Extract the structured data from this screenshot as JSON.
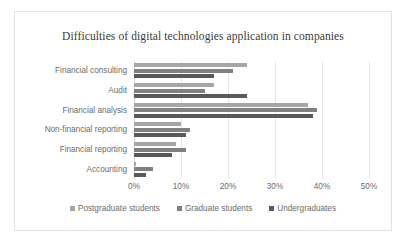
{
  "chart_data": {
    "type": "bar",
    "orientation": "horizontal",
    "title": "Difficulties of digital technologies application in companies",
    "xlabel": "",
    "ylabel": "",
    "xlim": [
      0,
      50
    ],
    "xticks": [
      "0%",
      "10%",
      "20%",
      "30%",
      "40%",
      "50%"
    ],
    "xtick_values": [
      0,
      10,
      20,
      30,
      40,
      50
    ],
    "grid": true,
    "legend_position": "bottom",
    "categories": [
      "Financial consulting",
      "Audit",
      "Financial analysis",
      "Non-financial reporting",
      "Financial reporting",
      "Accounting"
    ],
    "series": [
      {
        "name": "Postgraduate students",
        "color": "#a6a6a6",
        "values": [
          24,
          17,
          37,
          10,
          9,
          0.5
        ]
      },
      {
        "name": "Graduate students",
        "color": "#808080",
        "values": [
          21,
          15,
          39,
          12,
          11,
          4
        ]
      },
      {
        "name": "Undergraduates",
        "color": "#595959",
        "values": [
          17,
          24,
          38,
          11,
          8,
          2.5
        ]
      }
    ]
  }
}
